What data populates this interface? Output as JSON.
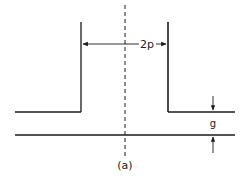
{
  "diagram": {
    "type": "slot-gap schematic",
    "labels": {
      "width": "2p",
      "gap": "g",
      "caption": "(a)"
    },
    "colors": {
      "stroke": "#1a1a1a",
      "background": "#ffffff"
    },
    "geometry": {
      "left_wall_x": 81,
      "right_wall_x": 168,
      "wall_top_y": 22,
      "ledge_y": 112,
      "base_y": 135,
      "centerline_x": 125
    }
  }
}
